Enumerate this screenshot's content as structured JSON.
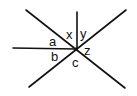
{
  "diagram": {
    "type": "intersecting-lines-angles",
    "stroke_color": "#111111",
    "background": "#ffffff",
    "center": {
      "x": 76,
      "y": 49
    },
    "lines": [
      {
        "id": "diagonal-tl-br",
        "x1": 26,
        "y1": 10,
        "x2": 125,
        "y2": 88
      },
      {
        "id": "diagonal-bl-tr",
        "x1": 29,
        "y1": 87,
        "x2": 126,
        "y2": 10
      },
      {
        "id": "horizontal-ray",
        "x1": 13,
        "y1": 48,
        "x2": 76,
        "y2": 49
      },
      {
        "id": "vertical-ray",
        "x1": 77,
        "y1": 12,
        "x2": 77,
        "y2": 49
      }
    ],
    "labels": {
      "a": "a",
      "b": "b",
      "c": "c",
      "x": "x",
      "y": "y",
      "z": "z"
    }
  }
}
